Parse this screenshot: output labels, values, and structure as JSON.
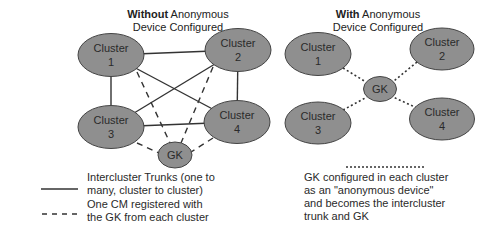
{
  "left_diagram": {
    "title_bold": "Without",
    "title_rest": " Anonymous",
    "title_line2": "Device Configured",
    "nodes": [
      {
        "id": "cluster1",
        "line1": "Cluster",
        "line2": "1"
      },
      {
        "id": "cluster2",
        "line1": "Cluster",
        "line2": "2"
      },
      {
        "id": "cluster3",
        "line1": "Cluster",
        "line2": "3"
      },
      {
        "id": "cluster4",
        "line1": "Cluster",
        "line2": "4"
      },
      {
        "id": "gk",
        "label": "GK"
      }
    ],
    "solid_links": [
      [
        "cluster1",
        "cluster2"
      ],
      [
        "cluster1",
        "cluster3"
      ],
      [
        "cluster1",
        "cluster4"
      ],
      [
        "cluster2",
        "cluster3"
      ],
      [
        "cluster2",
        "cluster4"
      ],
      [
        "cluster3",
        "cluster4"
      ]
    ],
    "dashed_links": [
      [
        "cluster1",
        "gk"
      ],
      [
        "cluster2",
        "gk"
      ],
      [
        "cluster3",
        "gk"
      ],
      [
        "cluster4",
        "gk"
      ]
    ]
  },
  "right_diagram": {
    "title_bold": "With",
    "title_rest": " Anonymous",
    "title_line2": "Device Configured",
    "nodes": [
      {
        "id": "cluster1",
        "line1": "Cluster",
        "line2": "1"
      },
      {
        "id": "cluster2",
        "line1": "Cluster",
        "line2": "2"
      },
      {
        "id": "cluster3",
        "line1": "Cluster",
        "line2": "3"
      },
      {
        "id": "cluster4",
        "line1": "Cluster",
        "line2": "4"
      },
      {
        "id": "gk",
        "label": "GK"
      }
    ],
    "dotted_links": [
      [
        "cluster1",
        "gk"
      ],
      [
        "cluster2",
        "gk"
      ],
      [
        "cluster3",
        "gk"
      ],
      [
        "cluster4",
        "gk"
      ]
    ]
  },
  "legend": {
    "solid": {
      "line1": "Intercluster Trunks (one to",
      "line2": "many, cluster to cluster)"
    },
    "dashed": {
      "line1": "One CM registered with",
      "line2": "the GK from each cluster"
    },
    "dotted": {
      "line1": "GK configured in each cluster",
      "line2": "as an \"anonymous device\"",
      "line3": "and becomes the intercluster",
      "line4": "trunk and GK"
    }
  },
  "colors": {
    "node_fill": "#8f8f8f",
    "node_stroke": "#444444",
    "line": "#333333",
    "text": "#2a2a2a"
  }
}
